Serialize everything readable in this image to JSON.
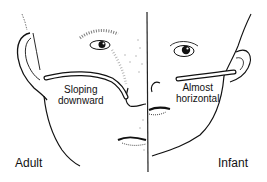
{
  "figure": {
    "left_panel": {
      "caption": "Adult",
      "tube_label_line1": "Sloping",
      "tube_label_line2": "downward"
    },
    "right_panel": {
      "caption": "Infant",
      "tube_label_line1": "Almost",
      "tube_label_line2": "horizontal"
    },
    "colors": {
      "ink": "#111111",
      "background": "#ffffff",
      "tube_fill": "#ffffff"
    }
  }
}
